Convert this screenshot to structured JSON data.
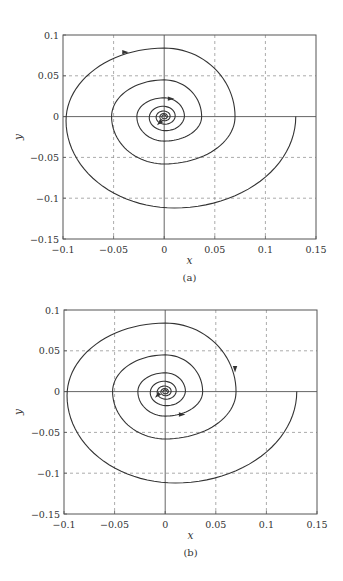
{
  "chart_data": [
    {
      "type": "line",
      "panel": "a",
      "caption": "(a)",
      "xlabel": "x",
      "ylabel": "y",
      "xlim": [
        -0.1,
        0.15
      ],
      "ylim": [
        -0.15,
        0.1
      ],
      "xticks": [
        -0.1,
        -0.05,
        0,
        0.05,
        0.1,
        0.15
      ],
      "xtick_labels": [
        "−0.1",
        "−0.05",
        "0",
        "0.05",
        "0.1",
        "0.15"
      ],
      "yticks": [
        -0.15,
        -0.1,
        -0.05,
        0,
        0.05,
        0.1
      ],
      "ytick_labels": [
        "−0.15",
        "−0.1",
        "−0.05",
        "0",
        "0.05",
        "0.1"
      ],
      "grid": "dashed",
      "series": [
        {
          "name": "phase trajectory",
          "description": "clockwise decaying spiral starting at (0.13, 0) converging to origin",
          "start": [
            0.13,
            0
          ],
          "crossings": [
            [
              0.13,
              0
            ],
            [
              0.01,
              -0.112
            ],
            [
              -0.097,
              -0.005
            ],
            [
              0,
              0.084
            ],
            [
              0.07,
              0
            ],
            [
              0,
              -0.058
            ],
            [
              -0.052,
              0
            ],
            [
              0,
              0.045
            ],
            [
              0.037,
              0
            ],
            [
              0,
              -0.03
            ],
            [
              -0.027,
              0
            ],
            [
              0,
              0.023
            ],
            [
              0.02,
              0
            ]
          ],
          "end": [
            0,
            0
          ]
        }
      ],
      "arrows": [
        {
          "x": -0.038,
          "y": 0.079,
          "direction": "right"
        },
        {
          "x": 0.007,
          "y": 0.022,
          "direction": "right"
        },
        {
          "x": -0.005,
          "y": -0.008,
          "direction": "down-left"
        }
      ],
      "axes_lines": {
        "x0": true,
        "y0": true
      }
    },
    {
      "type": "line",
      "panel": "b",
      "caption": "(b)",
      "xlabel": "x",
      "ylabel": "y",
      "xlim": [
        -0.1,
        0.15
      ],
      "ylim": [
        -0.15,
        0.1
      ],
      "xticks": [
        -0.1,
        -0.05,
        0,
        0.05,
        0.1,
        0.15
      ],
      "xtick_labels": [
        "−0.1",
        "−0.05",
        "0",
        "0.05",
        "0.1",
        "0.15"
      ],
      "yticks": [
        -0.15,
        -0.1,
        -0.05,
        0,
        0.05,
        0.1
      ],
      "ytick_labels": [
        "−0.15",
        "−0.1",
        "−0.05",
        "0",
        "0.05",
        "0.1"
      ],
      "grid": "dashed",
      "series": [
        {
          "name": "phase trajectory",
          "description": "clockwise decaying spiral starting at (0.13, 0) converging to origin",
          "start": [
            0.13,
            0
          ],
          "crossings": [
            [
              0.13,
              0
            ],
            [
              0.01,
              -0.112
            ],
            [
              -0.097,
              -0.005
            ],
            [
              0,
              0.084
            ],
            [
              0.07,
              0
            ],
            [
              0,
              -0.058
            ],
            [
              -0.052,
              0
            ],
            [
              0,
              0.045
            ],
            [
              0.037,
              0
            ],
            [
              0,
              -0.03
            ],
            [
              -0.027,
              0
            ],
            [
              0,
              0.023
            ],
            [
              0.02,
              0
            ]
          ],
          "end": [
            0,
            0
          ]
        }
      ],
      "arrows": [
        {
          "x": 0.069,
          "y": 0.027,
          "direction": "down"
        },
        {
          "x": 0.017,
          "y": -0.028,
          "direction": "right"
        },
        {
          "x": -0.008,
          "y": -0.005,
          "direction": "down-left"
        }
      ],
      "axes_lines": {
        "x0": true,
        "y0": true
      }
    }
  ],
  "layout": {
    "panels": [
      {
        "left": 63,
        "right": 316,
        "top": 35,
        "bottom": 239,
        "xlabel_y": 264,
        "caption_y": 281
      },
      {
        "left": 64,
        "right": 317,
        "top": 310,
        "bottom": 514,
        "xlabel_y": 539,
        "caption_y": 556
      }
    ],
    "colors": {
      "frame": "#555555",
      "grid": "#888888",
      "curve": "#333333",
      "text": "#333333"
    }
  }
}
